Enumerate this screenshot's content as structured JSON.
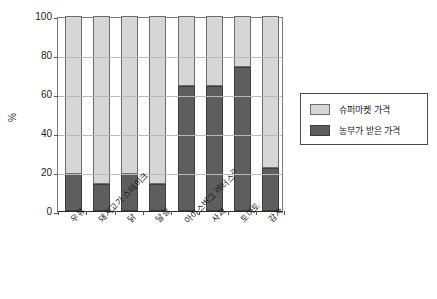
{
  "chart_data": {
    "type": "bar",
    "title": "",
    "subtitle": "",
    "stacked": true,
    "stacked_total": 100,
    "xlabel": "",
    "ylabel": "%",
    "ylim": [
      0,
      100
    ],
    "yticks": [
      0,
      20,
      40,
      60,
      80,
      100
    ],
    "ytick_labels": [
      "0",
      "20",
      "40",
      "60",
      "80",
      "100"
    ],
    "grid": true,
    "legend_position": "right",
    "categories": [
      "우유",
      "돼지고기 스테이크",
      "닭",
      "달걀",
      "아이스버그 레터스",
      "사과",
      "토마토",
      "감자"
    ],
    "category_superscripts": [
      "",
      "",
      "",
      "",
      "2)",
      "",
      "",
      ""
    ],
    "series": [
      {
        "name": "농부가 받은 가격",
        "color": "#5e5e5e",
        "values": [
          19,
          14,
          19,
          14,
          64,
          64,
          74,
          22
        ]
      },
      {
        "name": "슈퍼마켓 가격",
        "color": "#d6d6d6",
        "values": [
          81,
          86,
          81,
          86,
          36,
          36,
          26,
          78
        ]
      }
    ]
  },
  "legend": {
    "items": [
      {
        "label": "슈퍼마켓 가격",
        "swatch": "sw-super"
      },
      {
        "label": "농부가 받은 가격",
        "swatch": "sw-farmer"
      }
    ]
  }
}
